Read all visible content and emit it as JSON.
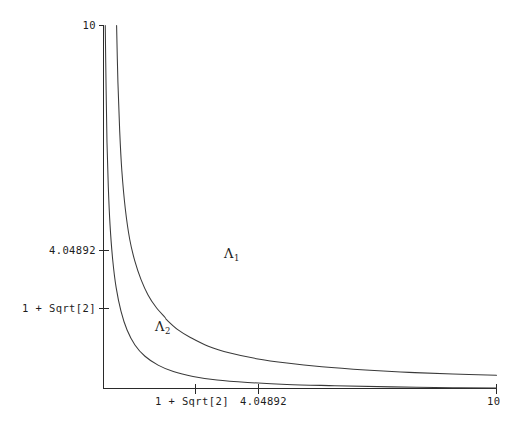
{
  "chart_data": {
    "type": "line",
    "title": "",
    "xlabel": "",
    "ylabel": "",
    "xlim": [
      1,
      10
    ],
    "ylim": [
      1,
      10
    ],
    "grid": false,
    "legend": "none",
    "axis_origin_label": "",
    "x_ticks": [
      {
        "value": 2.41421,
        "label": "1 + Sqrt[2]"
      },
      {
        "value": 4.04892,
        "label": "4.04892"
      },
      {
        "value": 10,
        "label": "10"
      }
    ],
    "y_ticks": [
      {
        "value": 2.41421,
        "label": "1 + Sqrt[2]"
      },
      {
        "value": 4.04892,
        "label": "4.04892"
      },
      {
        "value": 10,
        "label": "10"
      }
    ],
    "annotations": [
      {
        "name": "lambda-1",
        "text": "Λ",
        "sub": "1",
        "x": 4.9,
        "y": 4.15
      },
      {
        "name": "lambda-2",
        "text": "Λ",
        "sub": "2",
        "x": 2.55,
        "y": 2.28
      }
    ],
    "series": [
      {
        "name": "upper-boundary-curve",
        "comment": "Boundary between region Lambda-1 and Lambda-2, with a slope break near x = 2.45",
        "points": [
          [
            1.3,
            10.0
          ],
          [
            1.33,
            8.6
          ],
          [
            1.37,
            7.4
          ],
          [
            1.42,
            6.4
          ],
          [
            1.5,
            5.45
          ],
          [
            1.6,
            4.7
          ],
          [
            1.72,
            4.15
          ],
          [
            1.86,
            3.7
          ],
          [
            2.02,
            3.32
          ],
          [
            2.2,
            3.02
          ],
          [
            2.41,
            2.76
          ],
          [
            2.45,
            2.7
          ],
          [
            2.7,
            2.46
          ],
          [
            3.0,
            2.26
          ],
          [
            3.4,
            2.05
          ],
          [
            3.9,
            1.88
          ],
          [
            4.5,
            1.74
          ],
          [
            5.2,
            1.63
          ],
          [
            6.0,
            1.54
          ],
          [
            7.0,
            1.46
          ],
          [
            8.0,
            1.4
          ],
          [
            9.0,
            1.36
          ],
          [
            10.0,
            1.33
          ]
        ]
      },
      {
        "name": "lower-boundary-curve",
        "comment": "Lower boundary of region Lambda-2 approaching the x-axis asymptotically",
        "points": [
          [
            1.04,
            10.0
          ],
          [
            1.06,
            8.4
          ],
          [
            1.08,
            7.1
          ],
          [
            1.11,
            6.0
          ],
          [
            1.15,
            5.05
          ],
          [
            1.21,
            4.2
          ],
          [
            1.29,
            3.5
          ],
          [
            1.4,
            2.92
          ],
          [
            1.54,
            2.45
          ],
          [
            1.72,
            2.08
          ],
          [
            1.95,
            1.8
          ],
          [
            2.25,
            1.58
          ],
          [
            2.6,
            1.42
          ],
          [
            3.05,
            1.3
          ],
          [
            3.6,
            1.21
          ],
          [
            4.3,
            1.15
          ],
          [
            5.2,
            1.1
          ],
          [
            6.3,
            1.07
          ],
          [
            7.6,
            1.04
          ],
          [
            9.0,
            1.02
          ],
          [
            10.0,
            1.01
          ]
        ]
      }
    ]
  },
  "axes": {
    "y_axis_top_label": "10",
    "y_axis_mid_label": "4.04892",
    "y_axis_low_label": "1 + Sqrt[2]",
    "x_axis_first_label": "1 + Sqrt[2]",
    "x_axis_second_label": "4.04892",
    "x_axis_end_label": "10"
  },
  "regions": {
    "upper_region_label": "Λ",
    "upper_region_sub": "1",
    "lower_region_label": "Λ",
    "lower_region_sub": "2"
  },
  "style": {
    "curve_color": "#3a3a3a",
    "axis_color": "#2a2a2a",
    "background": "#ffffff",
    "text_color": "#1d1d1d"
  }
}
